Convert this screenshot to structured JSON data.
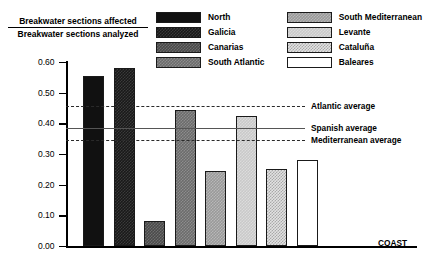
{
  "chart_data": {
    "type": "bar",
    "title": "",
    "ylabel_numerator": "Breakwater sections affected",
    "ylabel_denominator": "Breakwater sections analyzed",
    "xlabel": "COAST",
    "ylim": [
      0.0,
      0.6
    ],
    "ytick_labels": [
      "0.60",
      "0.50",
      "0.40",
      "0.30",
      "0.20",
      "0.10",
      "0.00"
    ],
    "ytick_values": [
      0.6,
      0.5,
      0.4,
      0.3,
      0.2,
      0.1,
      0.0
    ],
    "grid": false,
    "legend_position": "top-right",
    "categories": [
      "North",
      "Galicia",
      "Canarias",
      "South Atlantic",
      "South Mediterranean",
      "Levante",
      "Cataluña",
      "Baleares"
    ],
    "values": [
      0.555,
      0.58,
      0.08,
      0.445,
      0.245,
      0.425,
      0.25,
      0.28
    ],
    "bar_patterns": [
      "solid-black",
      "dark-check",
      "darkgray-check",
      "midgray-check",
      "gray-check",
      "lightgray",
      "dots",
      "white"
    ],
    "reference_lines": [
      {
        "name": "Atlantic average",
        "value": 0.455,
        "style": "dashed"
      },
      {
        "name": "Spanish average",
        "value": 0.385,
        "style": "solid"
      },
      {
        "name": "Mediterranean average",
        "value": 0.345,
        "style": "dashed"
      }
    ]
  },
  "legend": {
    "entries": [
      {
        "label": "North",
        "pattern": "solid-black"
      },
      {
        "label": "South Mediterranean",
        "pattern": "gray-check"
      },
      {
        "label": "Galicia",
        "pattern": "dark-check"
      },
      {
        "label": "Levante",
        "pattern": "lightgray"
      },
      {
        "label": "Canarias",
        "pattern": "darkgray-check"
      },
      {
        "label": "Cataluña",
        "pattern": "dots"
      },
      {
        "label": "South Atlantic",
        "pattern": "midgray-check"
      },
      {
        "label": "Baleares",
        "pattern": "white"
      }
    ]
  }
}
